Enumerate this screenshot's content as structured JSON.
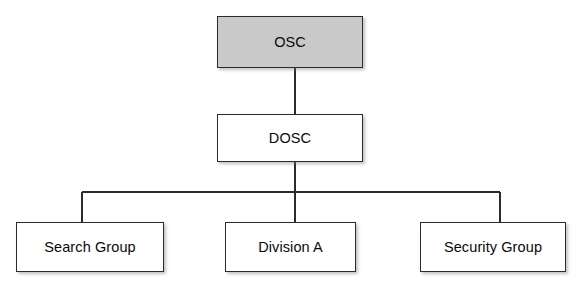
{
  "diagram": {
    "type": "org-chart",
    "title": "",
    "background_color": "#ffffff",
    "line_color": "#2b2b2b",
    "root_fill_color": "#c9c9c9",
    "node_fill_color": "#ffffff",
    "text_color": "#0a0a0a",
    "nodes": [
      {
        "id": "osc",
        "label": "OSC",
        "level": 0,
        "highlighted": true
      },
      {
        "id": "dosc",
        "label": "DOSC",
        "level": 1,
        "highlighted": false
      },
      {
        "id": "search_group",
        "label": "Search Group",
        "level": 2,
        "highlighted": false
      },
      {
        "id": "division_a",
        "label": "Division A",
        "level": 2,
        "highlighted": false
      },
      {
        "id": "security_group",
        "label": "Security Group",
        "level": 2,
        "highlighted": false
      }
    ],
    "edges": [
      {
        "from": "osc",
        "to": "dosc"
      },
      {
        "from": "dosc",
        "to": "search_group"
      },
      {
        "from": "dosc",
        "to": "division_a"
      },
      {
        "from": "dosc",
        "to": "security_group"
      }
    ]
  }
}
